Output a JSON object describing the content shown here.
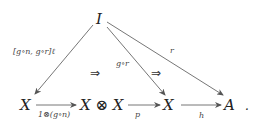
{
  "diagram": {
    "type": "commutative-diagram",
    "nodes": {
      "top": "I",
      "bottom_1": "X",
      "bottom_2": "X ⊗ X",
      "bottom_3": "X",
      "bottom_4": "A",
      "terminal_punct": "."
    },
    "arrows": {
      "I_to_X1": "[g∘n, g∘r]ℓ",
      "I_to_X3": "g∘r",
      "I_to_A": "r",
      "X1_to_XX": "1⊗(g∘n)",
      "XX_to_X3": "p",
      "X3_to_A": "h"
    },
    "two_cells": {
      "left": "⇒",
      "right": "⇒"
    },
    "colors": {
      "ink": "#222222",
      "arrow": "#666666"
    }
  }
}
